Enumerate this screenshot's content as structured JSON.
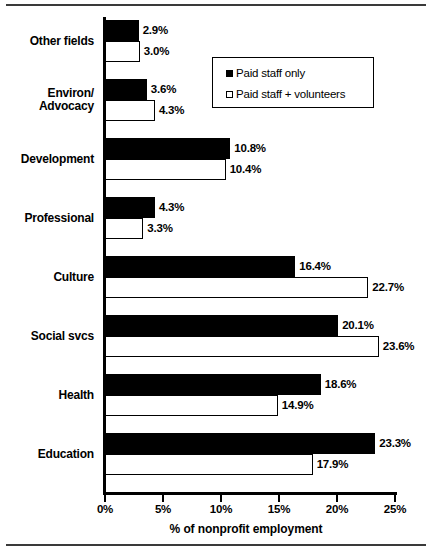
{
  "chart_data": {
    "type": "bar",
    "orientation": "horizontal",
    "title": "",
    "xlabel": "% of nonprofit employment",
    "ylabel": "",
    "xlim": [
      0,
      25
    ],
    "grid": false,
    "legend_position": "upper-right-inside",
    "xticks": [
      0,
      5,
      10,
      15,
      20,
      25
    ],
    "xticklabels": [
      "0%",
      "5%",
      "10%",
      "15%",
      "20%",
      "25%"
    ],
    "categories": [
      "Other fields",
      "Environ/ Advocacy",
      "Development",
      "Professional",
      "Culture",
      "Social svcs",
      "Health",
      "Education"
    ],
    "category_lines": [
      [
        "Other fields"
      ],
      [
        "Environ/",
        "Advocacy"
      ],
      [
        "Development"
      ],
      [
        "Professional"
      ],
      [
        "Culture"
      ],
      [
        "Social svcs"
      ],
      [
        "Health"
      ],
      [
        "Education"
      ]
    ],
    "series": [
      {
        "name": "Paid staff only",
        "style": "solid",
        "color": "#000000",
        "values": [
          2.9,
          3.6,
          10.8,
          4.3,
          16.4,
          20.1,
          18.6,
          23.3
        ],
        "labels": [
          "2.9%",
          "3.6%",
          "10.8%",
          "4.3%",
          "16.4%",
          "20.1%",
          "18.6%",
          "23.3%"
        ]
      },
      {
        "name": "Paid staff + volunteers",
        "style": "hollow",
        "color": "#ffffff",
        "values": [
          3.0,
          4.3,
          10.4,
          3.3,
          22.7,
          23.6,
          14.9,
          17.9
        ],
        "labels": [
          "3.0%",
          "4.3%",
          "10.4%",
          "3.3%",
          "22.7%",
          "23.6%",
          "14.9%",
          "17.9%"
        ]
      }
    ]
  },
  "legend": {
    "items": [
      {
        "label": "Paid staff only",
        "style": "solid"
      },
      {
        "label": "Paid staff + volunteers",
        "style": "hollow"
      }
    ]
  }
}
